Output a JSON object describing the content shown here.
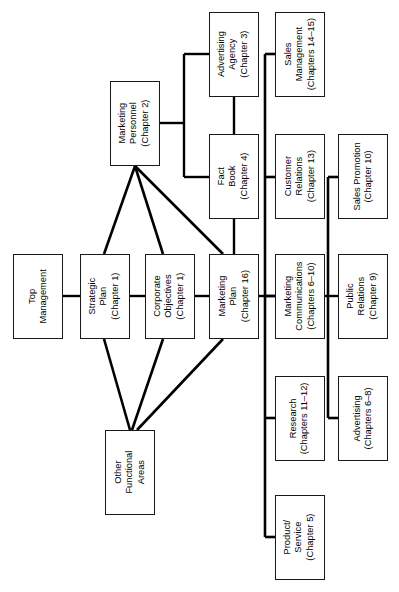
{
  "diagram": {
    "type": "organizational-flow-chart",
    "orientation": "rotated-90-ccw",
    "title": "",
    "colors": {
      "background": "#ffffff",
      "box_border": "#1a1a1a",
      "box_fill": "#ffffff",
      "edge": "#000000"
    },
    "nodes": [
      {
        "id": "top-management",
        "lines": [
          "Top",
          "Management"
        ],
        "x": 13,
        "y": 254,
        "w": 50,
        "h": 85
      },
      {
        "id": "strategic-plan",
        "lines": [
          "Strategic",
          "Plan",
          "(Chapter 1)"
        ],
        "x": 80,
        "y": 254,
        "w": 50,
        "h": 85
      },
      {
        "id": "corporate-objectives",
        "lines": [
          "Corporate",
          "Objectives",
          "(Chapter 1)"
        ],
        "x": 145,
        "y": 254,
        "w": 50,
        "h": 85
      },
      {
        "id": "marketing-plan",
        "lines": [
          "Marketing",
          "Plan",
          "(Chapter 16)"
        ],
        "x": 209,
        "y": 254,
        "w": 50,
        "h": 85
      },
      {
        "id": "marketing-personnel",
        "lines": [
          "Marketing",
          "Personnel",
          "(Chapter 2)"
        ],
        "x": 110,
        "y": 81,
        "w": 50,
        "h": 85
      },
      {
        "id": "advertising-agency",
        "lines": [
          "Advertising",
          "Agency",
          "(Chapter 3)"
        ],
        "x": 209,
        "y": 12,
        "w": 50,
        "h": 85
      },
      {
        "id": "fact-book",
        "lines": [
          "Fact",
          "Book",
          "(Chapter 4)"
        ],
        "x": 209,
        "y": 134,
        "w": 50,
        "h": 85
      },
      {
        "id": "other-functional-areas",
        "lines": [
          "Other",
          "Functional",
          "Areas"
        ],
        "x": 105,
        "y": 430,
        "w": 50,
        "h": 85
      },
      {
        "id": "sales-management",
        "lines": [
          "Sales",
          "Management",
          "(Chapters 14–15)"
        ],
        "x": 275,
        "y": 12,
        "w": 50,
        "h": 85
      },
      {
        "id": "customer-relations",
        "lines": [
          "Customer",
          "Relations",
          "(Chapter 13)"
        ],
        "x": 275,
        "y": 134,
        "w": 50,
        "h": 85
      },
      {
        "id": "marketing-communications",
        "lines": [
          "Marketing",
          "Communications",
          "(Chapters 6–10)"
        ],
        "x": 275,
        "y": 254,
        "w": 50,
        "h": 85
      },
      {
        "id": "research",
        "lines": [
          "Research",
          "(Chapters 11–12)"
        ],
        "x": 275,
        "y": 376,
        "w": 50,
        "h": 85
      },
      {
        "id": "product-service",
        "lines": [
          "Product/",
          "Service",
          "(Chapter 5)"
        ],
        "x": 275,
        "y": 495,
        "w": 50,
        "h": 85
      },
      {
        "id": "sales-promotion",
        "lines": [
          "Sales Promotion",
          "(Chapter 10)"
        ],
        "x": 338,
        "y": 134,
        "w": 50,
        "h": 85
      },
      {
        "id": "public-relations",
        "lines": [
          "Public",
          "Relations",
          "(Chapter 9)"
        ],
        "x": 338,
        "y": 254,
        "w": 50,
        "h": 85
      },
      {
        "id": "advertising",
        "lines": [
          "Advertising",
          "(Chapters 6–8)"
        ],
        "x": 338,
        "y": 376,
        "w": 50,
        "h": 85
      }
    ],
    "edges": [
      {
        "id": "top-management--strategic-plan",
        "kind": "straight",
        "d": "M63,296 L80,296",
        "w": 2.4
      },
      {
        "id": "strategic-plan--corporate-objectives",
        "kind": "straight",
        "d": "M130,296 L145,296",
        "w": 2.4
      },
      {
        "id": "corporate-objectives--marketing-plan",
        "kind": "straight",
        "d": "M195,296 L209,296",
        "w": 2.4
      },
      {
        "id": "marketing-plan--trunk-a",
        "kind": "straight",
        "d": "M259,296 L275,296",
        "w": 2.4
      },
      {
        "id": "marketing-personnel--strategic-plan",
        "kind": "straight",
        "d": "M135,166 L104,254",
        "w": 2.6
      },
      {
        "id": "marketing-personnel--corporate-objectives",
        "kind": "straight",
        "d": "M135,166 L163,254",
        "w": 2.6
      },
      {
        "id": "marketing-personnel--marketing-plan",
        "kind": "straight",
        "d": "M135,166 L223,254",
        "w": 2.6
      },
      {
        "id": "strategic-plan--other-functional-areas",
        "kind": "straight",
        "d": "M104,339 L130,430",
        "w": 2.6
      },
      {
        "id": "corporate-objectives--other-functional-areas",
        "kind": "straight",
        "d": "M163,339 L132,430",
        "w": 2.6
      },
      {
        "id": "marketing-plan--other-functional-areas",
        "kind": "straight",
        "d": "M223,339 L137,430",
        "w": 2.6
      },
      {
        "id": "marketing-personnel--branch-bus",
        "kind": "elbow",
        "d": "M160,123 L184,123",
        "w": 2.4
      },
      {
        "id": "branch-bus-vertical",
        "kind": "elbow",
        "d": "M184,54 L184,177",
        "w": 2.4
      },
      {
        "id": "branch-bus--advertising-agency",
        "kind": "elbow",
        "d": "M184,54 L209,54",
        "w": 2.4
      },
      {
        "id": "branch-bus--fact-book",
        "kind": "elbow",
        "d": "M184,177 L209,177",
        "w": 2.4
      },
      {
        "id": "advertising-agency--marketing-plan-col",
        "kind": "straight",
        "d": "M234,97 L234,134",
        "w": 2.4
      },
      {
        "id": "fact-book--marketing-plan-col",
        "kind": "straight",
        "d": "M234,219 L234,254",
        "w": 2.4
      },
      {
        "id": "trunk-a-vertical",
        "kind": "trunk",
        "d": "M265,54 L265,537",
        "w": 2.6
      },
      {
        "id": "trunk-a--sales-management",
        "kind": "straight",
        "d": "M265,54 L275,54",
        "w": 2.6
      },
      {
        "id": "trunk-a--customer-relations",
        "kind": "straight",
        "d": "M265,177 L275,177",
        "w": 2.6
      },
      {
        "id": "trunk-a--marketing-communications",
        "kind": "straight",
        "d": "M265,296 L275,296",
        "w": 2.6
      },
      {
        "id": "trunk-a--research",
        "kind": "straight",
        "d": "M265,418 L275,418",
        "w": 2.6
      },
      {
        "id": "trunk-a--product-service",
        "kind": "straight",
        "d": "M265,537 L275,537",
        "w": 2.6
      },
      {
        "id": "marketing-communications--trunk-b",
        "kind": "straight",
        "d": "M325,296 L338,296",
        "w": 2.4
      },
      {
        "id": "trunk-b-vertical",
        "kind": "trunk",
        "d": "M328,177 L328,418",
        "w": 2.6
      },
      {
        "id": "trunk-b--sales-promotion",
        "kind": "straight",
        "d": "M328,177 L338,177",
        "w": 2.6
      },
      {
        "id": "trunk-b--advertising",
        "kind": "straight",
        "d": "M328,418 L338,418",
        "w": 2.6
      }
    ]
  }
}
